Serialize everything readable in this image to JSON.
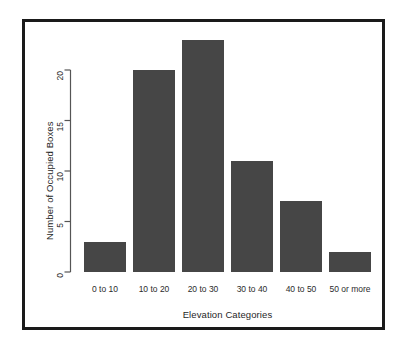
{
  "chart_data": {
    "type": "bar",
    "title": "",
    "subtitle": "",
    "categories": [
      "0 to 10",
      "10 to 20",
      "20 to 30",
      "30 to 40",
      "40 to 50",
      "50 or more"
    ],
    "values": [
      3,
      20,
      23,
      11,
      7,
      2
    ],
    "xlabel": "Elevation Categories",
    "ylabel": "Number of Occupied Boxes",
    "ylim": [
      0,
      23
    ],
    "yticks": [
      0,
      5,
      10,
      15,
      20
    ],
    "ytick_labels": [
      "0",
      "5",
      "10",
      "15",
      "20"
    ],
    "grid": false,
    "legend": null,
    "bar_color": "#464646",
    "axis_color": "#555555",
    "frame_color": "#1a1a1a",
    "background": "#ffffff",
    "annotations": []
  },
  "figure": {
    "frame_label": "chart-frame"
  }
}
